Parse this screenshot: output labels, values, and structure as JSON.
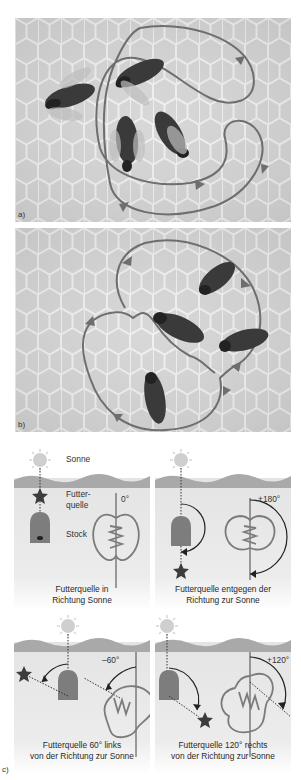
{
  "figure": {
    "panel_a": {
      "label": "a)",
      "description": "Rundtanz der Honigbienen auf der Wabe"
    },
    "panel_b": {
      "label": "b)",
      "description": "Schwänzeltanz der Honigbienen auf der Wabe"
    },
    "panel_c": {
      "label": "c)",
      "legend": {
        "sun": "Sonne",
        "food_source_line1": "Futter-",
        "food_source_line2": "quelle",
        "hive": "Stock"
      },
      "subpanels": [
        {
          "angle": "0°",
          "caption_line1": "Futterquelle in",
          "caption_line2": "Richtung Sonne"
        },
        {
          "angle": "+180°",
          "caption_line1": "Futterquelle entgegen der",
          "caption_line2": "Richtung zur Sonne"
        },
        {
          "angle": "–60°",
          "caption_line1": "Futterquelle  60° links",
          "caption_line2": "von der Richtung zur Sonne"
        },
        {
          "angle": "+120°",
          "caption_line1": "Futterquelle 120° rechts",
          "caption_line2": "von der Richtung zur Sonne"
        }
      ]
    },
    "colors": {
      "comb": "#d9d9d9",
      "comb_line": "#f2f2f2",
      "path": "#6e6e6e",
      "water": "#a9a9a9",
      "panel_bg": "#e6e6e6",
      "hive": "#7d7d7d",
      "star": "#3c3c3c",
      "sun": "#c9c9c9"
    }
  }
}
